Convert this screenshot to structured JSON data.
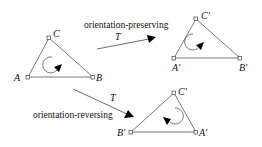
{
  "diagram": {
    "transform_label": "T",
    "original": {
      "vertices": {
        "A": "A",
        "B": "B",
        "C": "C"
      },
      "orientation": "counterclockwise"
    },
    "preserving": {
      "caption": "orientation-preserving",
      "transform_label": "T",
      "vertices": {
        "A": "A′",
        "B": "B′",
        "C": "C′"
      },
      "orientation": "counterclockwise"
    },
    "reversing": {
      "caption": "orientation-reversing",
      "transform_label": "T",
      "vertices": {
        "A": "A′",
        "B": "B′",
        "C": "C′"
      },
      "orientation": "clockwise"
    }
  }
}
